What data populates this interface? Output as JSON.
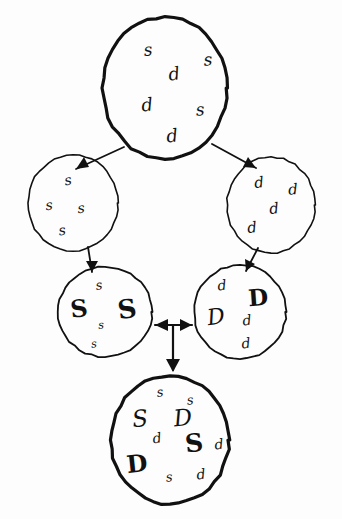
{
  "diagram": {
    "title": "Hand-drawn set refinement diagram",
    "style": "hand-drawn pen sketch",
    "background_color": "#fdfdfd",
    "ink_color": "#111111",
    "node_count": 6,
    "arrow_count": 6
  },
  "nodes": [
    {
      "id": "root",
      "name": "root-set",
      "cx": 165,
      "cy": 88,
      "rx": 62,
      "ry": 71,
      "stroke_width": 3.2,
      "items": [
        {
          "text": "s",
          "x": 148,
          "y": 50,
          "size": 17,
          "weight": "thin",
          "rotate": -6
        },
        {
          "text": "s",
          "x": 208,
          "y": 60,
          "size": 17,
          "weight": "thin",
          "rotate": -4
        },
        {
          "text": "d",
          "x": 174,
          "y": 74,
          "size": 18,
          "weight": "thin",
          "rotate": -8
        },
        {
          "text": "d",
          "x": 147,
          "y": 105,
          "size": 18,
          "weight": "thin",
          "rotate": -6
        },
        {
          "text": "s",
          "x": 200,
          "y": 110,
          "size": 17,
          "weight": "thin",
          "rotate": -5
        },
        {
          "text": "d",
          "x": 172,
          "y": 136,
          "size": 18,
          "weight": "thin",
          "rotate": -6
        }
      ]
    },
    {
      "id": "left-s",
      "name": "s-only-set",
      "cx": 73,
      "cy": 203,
      "rx": 45,
      "ry": 48,
      "stroke_width": 1.6,
      "items": [
        {
          "text": "s",
          "x": 68,
          "y": 180,
          "size": 14,
          "weight": "thin",
          "rotate": -10
        },
        {
          "text": "s",
          "x": 49,
          "y": 205,
          "size": 14,
          "weight": "thin",
          "rotate": -6
        },
        {
          "text": "s",
          "x": 81,
          "y": 208,
          "size": 14,
          "weight": "thin",
          "rotate": -6
        },
        {
          "text": "s",
          "x": 62,
          "y": 230,
          "size": 14,
          "weight": "thin",
          "rotate": -8
        }
      ]
    },
    {
      "id": "right-d",
      "name": "d-only-set",
      "cx": 271,
      "cy": 205,
      "rx": 44,
      "ry": 48,
      "stroke_width": 1.6,
      "items": [
        {
          "text": "d",
          "x": 259,
          "y": 183,
          "size": 15,
          "weight": "thin",
          "rotate": -6
        },
        {
          "text": "d",
          "x": 293,
          "y": 190,
          "size": 15,
          "weight": "thin",
          "rotate": -4
        },
        {
          "text": "d",
          "x": 274,
          "y": 209,
          "size": 15,
          "weight": "thin",
          "rotate": -6
        },
        {
          "text": "d",
          "x": 252,
          "y": 228,
          "size": 15,
          "weight": "thin",
          "rotate": -6
        }
      ]
    },
    {
      "id": "lower-left-S",
      "name": "s-refined-set",
      "cx": 105,
      "cy": 312,
      "rx": 47,
      "ry": 45,
      "stroke_width": 1.8,
      "items": [
        {
          "text": "s",
          "x": 99,
          "y": 285,
          "size": 13,
          "weight": "thin",
          "rotate": -8
        },
        {
          "text": "S",
          "x": 79,
          "y": 309,
          "size": 24,
          "weight": "bold",
          "rotate": -6
        },
        {
          "text": "S",
          "x": 127,
          "y": 309,
          "size": 26,
          "weight": "bold",
          "rotate": -8
        },
        {
          "text": "s",
          "x": 101,
          "y": 325,
          "size": 11,
          "weight": "thin",
          "rotate": -4
        },
        {
          "text": "s",
          "x": 94,
          "y": 344,
          "size": 11,
          "weight": "thin",
          "rotate": -6
        }
      ]
    },
    {
      "id": "lower-right-D",
      "name": "d-refined-set",
      "cx": 240,
      "cy": 312,
      "rx": 46,
      "ry": 47,
      "stroke_width": 1.8,
      "items": [
        {
          "text": "d",
          "x": 222,
          "y": 285,
          "size": 14,
          "weight": "thin",
          "rotate": -6
        },
        {
          "text": "D",
          "x": 258,
          "y": 297,
          "size": 23,
          "weight": "bold",
          "rotate": -4
        },
        {
          "text": "D",
          "x": 216,
          "y": 317,
          "size": 22,
          "weight": "outline",
          "rotate": -8
        },
        {
          "text": "d",
          "x": 247,
          "y": 320,
          "size": 14,
          "weight": "thin",
          "rotate": -6
        },
        {
          "text": "d",
          "x": 246,
          "y": 343,
          "size": 14,
          "weight": "thin",
          "rotate": -6
        }
      ]
    },
    {
      "id": "bottom-all",
      "name": "combined-set",
      "cx": 170,
      "cy": 440,
      "rx": 59,
      "ry": 64,
      "stroke_width": 3.2,
      "items": [
        {
          "text": "s",
          "x": 160,
          "y": 392,
          "size": 13,
          "weight": "thin",
          "rotate": -8
        },
        {
          "text": "s",
          "x": 190,
          "y": 400,
          "size": 13,
          "weight": "thin",
          "rotate": -6
        },
        {
          "text": "S",
          "x": 140,
          "y": 419,
          "size": 23,
          "weight": "outline",
          "rotate": -6
        },
        {
          "text": "D",
          "x": 183,
          "y": 418,
          "size": 23,
          "weight": "outline",
          "rotate": -6
        },
        {
          "text": "d",
          "x": 157,
          "y": 438,
          "size": 14,
          "weight": "thin",
          "rotate": -8
        },
        {
          "text": "S",
          "x": 194,
          "y": 443,
          "size": 25,
          "weight": "bold",
          "rotate": -6
        },
        {
          "text": "d",
          "x": 219,
          "y": 444,
          "size": 14,
          "weight": "thin",
          "rotate": -6
        },
        {
          "text": "D",
          "x": 137,
          "y": 464,
          "size": 24,
          "weight": "bold",
          "rotate": -6
        },
        {
          "text": "s",
          "x": 169,
          "y": 477,
          "size": 13,
          "weight": "thin",
          "rotate": -6
        },
        {
          "text": "d",
          "x": 201,
          "y": 474,
          "size": 14,
          "weight": "thin",
          "rotate": -6
        }
      ]
    }
  ],
  "arrows": [
    {
      "id": "root-to-left",
      "name": "arrow-root-to-s-set",
      "from": "root",
      "to": "left-s",
      "path": "M 124 147 L 76 169",
      "head": "end",
      "head_points": "76,169 89,167 84,157",
      "stroke_width": 1.8
    },
    {
      "id": "root-to-right",
      "name": "arrow-root-to-d-set",
      "from": "root",
      "to": "right-d",
      "path": "M 212 144 L 256 168",
      "head": "end",
      "head_points": "256,168 243,167 248,157",
      "stroke_width": 1.8
    },
    {
      "id": "left-to-lowerleft",
      "name": "arrow-s-set-to-s-refined",
      "from": "left-s",
      "to": "lower-left-S",
      "path": "M 88 247 L 92 272",
      "head": "end",
      "head_points": "92,272 86,261 98,261",
      "stroke_width": 1.8
    },
    {
      "id": "right-to-lowerright",
      "name": "arrow-d-set-to-d-refined",
      "from": "right-d",
      "to": "lower-right-D",
      "path": "M 258 248 L 246 271",
      "head": "end",
      "head_points": "246,271 245,259 255,264",
      "stroke_width": 1.8
    },
    {
      "id": "lowerleft-lowerright",
      "name": "arrow-bidirectional-refined-sets",
      "from": "lower-left-S",
      "to": "lower-right-D",
      "path": "M 155 325 L 192 325",
      "head": "both",
      "head_points": "155,325 168,319 168,331",
      "head_points_end": "192,325 180,319 180,331",
      "stroke_width": 2.2
    },
    {
      "id": "merge-to-bottom",
      "name": "arrow-merge-to-combined",
      "from": "lowerleft-lowerright",
      "to": "bottom-all",
      "path": "M 173 325 L 173 370",
      "head": "end",
      "head_points": "173,372 166,359 180,359",
      "stroke_width": 2.2
    }
  ]
}
